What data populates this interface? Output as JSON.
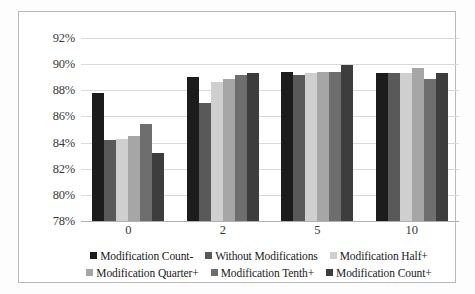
{
  "chart_data": {
    "type": "bar",
    "title": "",
    "xlabel": "",
    "ylabel": "",
    "categories": [
      "0",
      "2",
      "5",
      "10"
    ],
    "ylim": [
      78,
      92
    ],
    "ytick_labels": [
      "92%",
      "90%",
      "88%",
      "86%",
      "84%",
      "82%",
      "80%",
      "78%"
    ],
    "ytick_values": [
      92,
      90,
      88,
      86,
      84,
      82,
      80,
      78
    ],
    "ytick_step": 2,
    "value_suffix": "%",
    "grid": true,
    "legend_position": "bottom",
    "series": [
      {
        "name": "Modification Count-",
        "color": "#1c1c1c",
        "values": [
          87.8,
          89.0,
          89.4,
          89.3
        ]
      },
      {
        "name": "Without Modifications",
        "color": "#595959",
        "values": [
          84.2,
          87.0,
          89.2,
          89.3
        ]
      },
      {
        "name": "Modification Half+",
        "color": "#cfcfcf",
        "values": [
          84.3,
          88.6,
          89.3,
          89.3
        ]
      },
      {
        "name": "Modification Quarter+",
        "color": "#a6a6a6",
        "values": [
          84.5,
          88.9,
          89.4,
          89.7
        ]
      },
      {
        "name": "Modification Tenth+",
        "color": "#6e6e6e",
        "values": [
          85.4,
          89.2,
          89.4,
          88.9
        ]
      },
      {
        "name": "Modification Count+",
        "color": "#3d3d3d",
        "values": [
          83.2,
          89.3,
          89.9,
          89.3
        ]
      }
    ]
  }
}
